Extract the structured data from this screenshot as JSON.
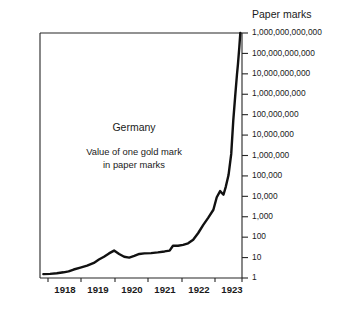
{
  "chart_data": {
    "type": "line",
    "title": "Germany",
    "subtitle_line1": "Value of one gold mark",
    "subtitle_line2": "in paper marks",
    "ylabel": "Paper marks",
    "xlabel": "",
    "yscale": "log",
    "ylim": [
      1,
      1000000000000
    ],
    "xlim": [
      1917.6,
      1923.6
    ],
    "grid": false,
    "legend": false,
    "ytick_labels": [
      "1,000,000,000,000",
      "100,000,000,000",
      "10,000,000,000",
      "1,000,000,000",
      "100,000,000",
      "10,000,000",
      "1,000,000",
      "100,000",
      "10,000",
      "1,000",
      "100",
      "10",
      "1"
    ],
    "ytick_values": [
      1000000000000,
      100000000000,
      10000000000,
      1000000000,
      100000000,
      10000000,
      1000000,
      100000,
      10000,
      1000,
      100,
      10,
      1
    ],
    "xtick_labels": [
      "1918",
      "1919",
      "1920",
      "1921",
      "1922",
      "1923"
    ],
    "xtick_values": [
      1918,
      1919,
      1920,
      1921,
      1922,
      1923
    ],
    "series": [
      {
        "name": "Value of one gold mark in paper marks",
        "color": "#111111",
        "x": [
          1917.7,
          1917.9,
          1918.1,
          1918.3,
          1918.45,
          1918.6,
          1918.8,
          1919.0,
          1919.2,
          1919.35,
          1919.5,
          1919.65,
          1919.8,
          1919.95,
          1920.1,
          1920.25,
          1920.4,
          1920.55,
          1920.7,
          1920.9,
          1921.1,
          1921.3,
          1921.45,
          1921.55,
          1921.7,
          1921.85,
          1922.0,
          1922.15,
          1922.3,
          1922.45,
          1922.6,
          1922.75,
          1922.85,
          1922.95,
          1923.05,
          1923.12,
          1923.2,
          1923.28,
          1923.34,
          1923.4,
          1923.45,
          1923.48,
          1923.52,
          1923.55
        ],
        "y": [
          1.55,
          1.6,
          1.7,
          1.9,
          2.1,
          2.6,
          3.2,
          4.0,
          5.5,
          8.0,
          11.0,
          16.0,
          22.0,
          15.0,
          11.0,
          10.0,
          12.0,
          15.0,
          16.0,
          16.5,
          18.0,
          20.0,
          22.0,
          38.0,
          38.0,
          42.0,
          50.0,
          75.0,
          160.0,
          400.0,
          900.0,
          2200.0,
          9000.0,
          18000.0,
          12000.0,
          30000.0,
          110000.0,
          1200000.0,
          50000000.0,
          900000000.0,
          9000000000.0,
          30000000000.0,
          200000000000.0,
          1000000000000.0
        ]
      }
    ]
  },
  "plot": {
    "frame": {
      "left": 40,
      "top": 33,
      "right": 242,
      "bottom": 278
    },
    "ytick_x_offset": 6,
    "ytick_label_x": 252,
    "axis_title_pos": {
      "x": 252,
      "y": 18
    },
    "annot_main_pos": {
      "x": 134,
      "y": 131
    },
    "annot_sub1_pos": {
      "x": 134,
      "y": 155
    },
    "annot_sub2_pos": {
      "x": 134,
      "y": 168
    },
    "xtick_label_y": 293,
    "xtick_positions": [
      65,
      98,
      132,
      165,
      199,
      232
    ],
    "xtick_mark_positions": [
      48,
      81,
      115,
      148,
      182,
      215,
      242
    ]
  }
}
